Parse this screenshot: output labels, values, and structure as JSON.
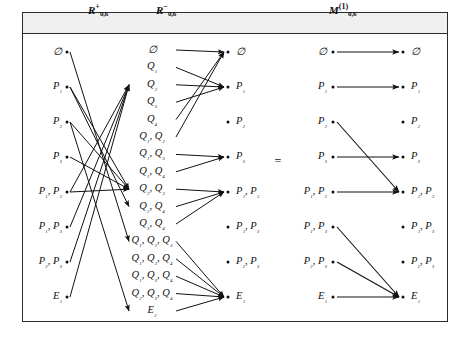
{
  "figure": {
    "title_headers": [
      {
        "base": "R",
        "sup": "+",
        "sub": "0,6",
        "x": 110
      },
      {
        "base": "R",
        "sup": "−",
        "sub": "0,6",
        "x": 177
      },
      {
        "base": "M",
        "sup": "(1)",
        "sub": "0,6",
        "x": 350
      }
    ],
    "equals_sign": "=",
    "columns": {
      "left_source": {
        "name": "R-plus-source",
        "labels": [
          "∅",
          "P₁",
          "P₂",
          "P₃",
          "P₁, P₂",
          "P₁, P₃",
          "P₂, P₃",
          "E₁"
        ]
      },
      "middle": {
        "name": "Q-middle",
        "labels": [
          "∅",
          "Q₁",
          "Q₂",
          "Q₃",
          "Q₄",
          "Q₁, Q₂",
          "Q₁, Q₃",
          "Q₁, Q₄",
          "Q₂, Q₃",
          "Q₂, Q₄",
          "Q₃, Q₄",
          "Q₁, Q₂, Q₃",
          "Q₁, Q₂, Q₄",
          "Q₁, Q₃, Q₄",
          "Q₂, Q₃, Q₄",
          "E₂"
        ]
      },
      "right_of_middle_target": {
        "name": "R-minus-target",
        "labels": [
          "∅",
          "P₁",
          "P₂",
          "P₃",
          "P₁, P₂",
          "P₁, P₃",
          "P₂, P₃",
          "E₁"
        ]
      },
      "composite_source": {
        "name": "M-source",
        "labels": [
          "∅",
          "P₁",
          "P₂",
          "P₃",
          "P₁, P₂",
          "P₁, P₃",
          "P₂, P₃",
          "E₁"
        ]
      },
      "composite_target": {
        "name": "M-target",
        "labels": [
          "∅",
          "P₁",
          "P₂",
          "P₃",
          "P₁, P₂",
          "P₁, P₃",
          "P₂, P₃",
          "E₁"
        ]
      }
    },
    "edges_r_plus": [
      {
        "from": 0,
        "to": 11
      },
      {
        "from": 1,
        "to": 8
      },
      {
        "from": 1,
        "to": 9
      },
      {
        "from": 2,
        "to": 8
      },
      {
        "from": 2,
        "to": 15
      },
      {
        "from": 3,
        "to": 8
      },
      {
        "from": 4,
        "to": 8
      },
      {
        "from": 4,
        "to": 2
      },
      {
        "from": 5,
        "to": 2
      },
      {
        "from": 6,
        "to": 2
      },
      {
        "from": 7,
        "to": 2
      }
    ],
    "edges_r_minus": [
      {
        "from": 0,
        "to": 0
      },
      {
        "from": 1,
        "to": 1
      },
      {
        "from": 2,
        "to": 1
      },
      {
        "from": 3,
        "to": 1
      },
      {
        "from": 4,
        "to": 0
      },
      {
        "from": 5,
        "to": 0
      },
      {
        "from": 6,
        "to": 3
      },
      {
        "from": 7,
        "to": 3
      },
      {
        "from": 8,
        "to": 4
      },
      {
        "from": 9,
        "to": 4
      },
      {
        "from": 10,
        "to": 4
      },
      {
        "from": 11,
        "to": 7
      },
      {
        "from": 12,
        "to": 7
      },
      {
        "from": 13,
        "to": 7
      },
      {
        "from": 14,
        "to": 7
      },
      {
        "from": 15,
        "to": 7
      }
    ],
    "edges_composite": [
      {
        "from": 0,
        "to": 0
      },
      {
        "from": 1,
        "to": 1
      },
      {
        "from": 2,
        "to": 4
      },
      {
        "from": 3,
        "to": 3
      },
      {
        "from": 4,
        "to": 4
      },
      {
        "from": 5,
        "to": 7
      },
      {
        "from": 6,
        "to": 7
      },
      {
        "from": 7,
        "to": 7
      }
    ],
    "colors": {
      "ink": "#111111",
      "frame": "#2b2b2b",
      "header_band": "#f0f0f0"
    }
  }
}
